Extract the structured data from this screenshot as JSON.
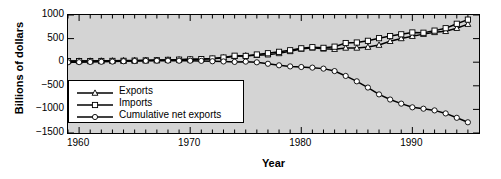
{
  "chart_data": {
    "type": "line",
    "title": "",
    "xlabel": "Year",
    "ylabel": "Billions of dollars",
    "xlim": [
      1959,
      1996
    ],
    "ylim": [
      -1500,
      1000
    ],
    "grid": false,
    "legend_position": "center-left-inside",
    "x_major_ticks": [
      1960,
      1970,
      1980,
      1990
    ],
    "x_major_tick_labels": [
      "1960",
      "1970",
      "1980",
      "1990"
    ],
    "x_minor_tick_step": 1,
    "y_ticks": [
      1000,
      500,
      0,
      -500,
      -1000,
      -1500
    ],
    "y_tick_labels": [
      "1000",
      "500",
      "0",
      "−500",
      "−1000",
      "−1500"
    ],
    "x": [
      1959,
      1960,
      1961,
      1962,
      1963,
      1964,
      1965,
      1966,
      1967,
      1968,
      1969,
      1970,
      1971,
      1972,
      1973,
      1974,
      1975,
      1976,
      1977,
      1978,
      1979,
      1980,
      1981,
      1982,
      1983,
      1984,
      1985,
      1986,
      1987,
      1988,
      1989,
      1990,
      1991,
      1992,
      1993,
      1994,
      1995
    ],
    "series": [
      {
        "name": "Exports",
        "marker": "triangle",
        "color": "#000000",
        "values": [
          21,
          26,
          27,
          29,
          31,
          36,
          38,
          42,
          44,
          49,
          53,
          60,
          63,
          71,
          95,
          127,
          139,
          149,
          159,
          187,
          230,
          281,
          305,
          283,
          277,
          303,
          303,
          321,
          364,
          445,
          504,
          552,
          595,
          633,
          656,
          721,
          807
        ]
      },
      {
        "name": "Imports",
        "marker": "square",
        "color": "#000000",
        "values": [
          23,
          23,
          23,
          25,
          27,
          29,
          33,
          38,
          41,
          49,
          54,
          60,
          66,
          79,
          99,
          137,
          133,
          163,
          190,
          220,
          253,
          294,
          318,
          304,
          329,
          406,
          417,
          453,
          509,
          554,
          591,
          630,
          624,
          669,
          720,
          814,
          902
        ]
      },
      {
        "name": "Cumulative net exports",
        "marker": "circle",
        "color": "#000000",
        "values": [
          -2,
          1,
          5,
          9,
          13,
          20,
          25,
          29,
          32,
          32,
          31,
          31,
          28,
          20,
          16,
          6,
          12,
          -2,
          -33,
          -66,
          -89,
          -102,
          -115,
          -136,
          -188,
          -291,
          -405,
          -537,
          -682,
          -791,
          -878,
          -956,
          -985,
          -1021,
          -1085,
          -1178,
          -1273
        ]
      }
    ]
  },
  "axes": {
    "ylabel": "Billions of dollars",
    "xlabel": "Year"
  },
  "legend": {
    "items": [
      {
        "label": "Exports",
        "marker": "triangle"
      },
      {
        "label": "Imports",
        "marker": "square"
      },
      {
        "label": "Cumulative net exports",
        "marker": "circle"
      }
    ]
  },
  "style": {
    "plot_background": "#d4d4d4",
    "figure_background": "#ffffff",
    "line_color": "#000000",
    "marker_fill": "#ffffff",
    "axis_color": "#000000"
  }
}
